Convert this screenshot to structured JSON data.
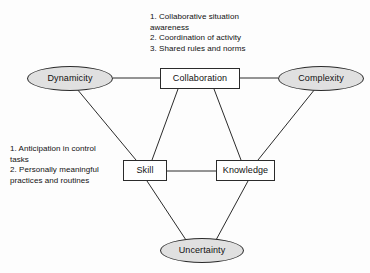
{
  "diagram": {
    "type": "concept-network-diagram",
    "nodes": [
      {
        "id": "dynamicity",
        "label": "Dynamicity",
        "shape": "ellipse",
        "fill": "#e0e0e0",
        "x": 27,
        "y": 66,
        "w": 86,
        "h": 25
      },
      {
        "id": "collaboration",
        "label": "Collaboration",
        "shape": "rectangle",
        "fill": "#ffffff",
        "x": 160,
        "y": 68,
        "w": 80,
        "h": 21
      },
      {
        "id": "complexity",
        "label": "Complexity",
        "shape": "ellipse",
        "fill": "#e0e0e0",
        "x": 278,
        "y": 66,
        "w": 86,
        "h": 25
      },
      {
        "id": "skill",
        "label": "Skill",
        "shape": "rectangle",
        "fill": "#ffffff",
        "x": 123,
        "y": 160,
        "w": 44,
        "h": 21
      },
      {
        "id": "knowledge",
        "label": "Knowledge",
        "shape": "rectangle",
        "fill": "#ffffff",
        "x": 216,
        "y": 160,
        "w": 59,
        "h": 21
      },
      {
        "id": "uncertainty",
        "label": "Uncertainty",
        "shape": "ellipse",
        "fill": "#e0e0e0",
        "x": 160,
        "y": 238,
        "w": 84,
        "h": 25
      }
    ],
    "edges": [
      {
        "from": "dynamicity",
        "to": "collaboration",
        "x1": 113,
        "y1": 78,
        "x2": 160,
        "y2": 78
      },
      {
        "from": "collaboration",
        "to": "complexity",
        "x1": 240,
        "y1": 78,
        "x2": 278,
        "y2": 78
      },
      {
        "from": "dynamicity",
        "to": "skill",
        "x1": 77,
        "y1": 89,
        "x2": 136,
        "y2": 160
      },
      {
        "from": "collaboration",
        "to": "skill",
        "x1": 178,
        "y1": 89,
        "x2": 152,
        "y2": 160
      },
      {
        "from": "collaboration",
        "to": "knowledge",
        "x1": 214,
        "y1": 89,
        "x2": 241,
        "y2": 160
      },
      {
        "from": "complexity",
        "to": "knowledge",
        "x1": 315,
        "y1": 89,
        "x2": 258,
        "y2": 160
      },
      {
        "from": "skill",
        "to": "knowledge",
        "x1": 167,
        "y1": 171,
        "x2": 216,
        "y2": 171
      },
      {
        "from": "skill",
        "to": "uncertainty",
        "x1": 147,
        "y1": 181,
        "x2": 186,
        "y2": 240
      },
      {
        "from": "knowledge",
        "to": "uncertainty",
        "x1": 248,
        "y1": 181,
        "x2": 216,
        "y2": 240
      }
    ],
    "line_color": "#2b2b2b",
    "annotations": [
      {
        "id": "collaboration-notes",
        "text": "1. Collaborative situation\nawareness\n2. Coordination of activity\n3. Shared rules and norms",
        "x": 150,
        "y": 12,
        "w": 150
      },
      {
        "id": "skill-notes",
        "text": "1. Anticipation in control\ntasks\n2. Personally meaningful\npractices and routines",
        "x": 10,
        "y": 144,
        "w": 120
      }
    ]
  }
}
